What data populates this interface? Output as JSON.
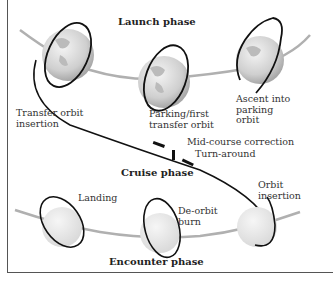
{
  "diagram": {
    "phases": {
      "launch": "Launch phase",
      "cruise": "Cruise phase",
      "encounter": "Encounter phase"
    },
    "labels": {
      "transfer_orbit_insertion": "Transfer orbit\ninsertion",
      "parking_first_transfer": "Parking/first\ntransfer orbit",
      "ascent_parking": "Ascent into\nparking\norbit",
      "mid_course": "Mid-course correction",
      "turn_around": "Turn-around",
      "orbit_insertion": "Orbit\ninsertion",
      "landing": "Landing",
      "de_orbit_burn": "De-orbit\nburn"
    },
    "colors": {
      "earth": "#d8d8d8",
      "planet": "#e6e6e6",
      "orbit": "#1a1a1a",
      "path": "#aaaaaa",
      "frame": "#555555"
    }
  }
}
